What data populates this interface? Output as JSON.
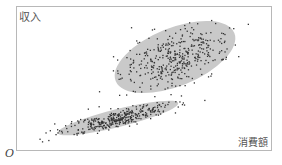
{
  "chart_data": {
    "type": "scatter",
    "title": "",
    "xlabel": "消費額",
    "ylabel": "収入",
    "origin_label": "O",
    "grid": false,
    "legend": null,
    "axis_ticks": "none",
    "clusters": [
      {
        "name": "upper cluster",
        "description": "wide oval cluster, higher income relative to consumption",
        "ellipse": {
          "cx_px": 175,
          "cy_px": 57,
          "rx_px": 64,
          "ry_px": 29,
          "rotate_deg": -22
        },
        "fill": "#c8c8c8",
        "approx_points": 400
      },
      {
        "name": "lower cluster",
        "description": "narrow elongated cluster, lower income relative to consumption",
        "ellipse": {
          "cx_px": 118,
          "cy_px": 118,
          "rx_px": 62,
          "ry_px": 9,
          "rotate_deg": -14
        },
        "fill": "#c8c8c8",
        "approx_points": 350
      }
    ]
  },
  "labels": {
    "y_axis": "収入",
    "x_axis": "消費額",
    "origin": "O"
  },
  "colors": {
    "point": "#333333",
    "ellipse_fill": "#c9c9c9",
    "frame": "#b8b8b8"
  }
}
